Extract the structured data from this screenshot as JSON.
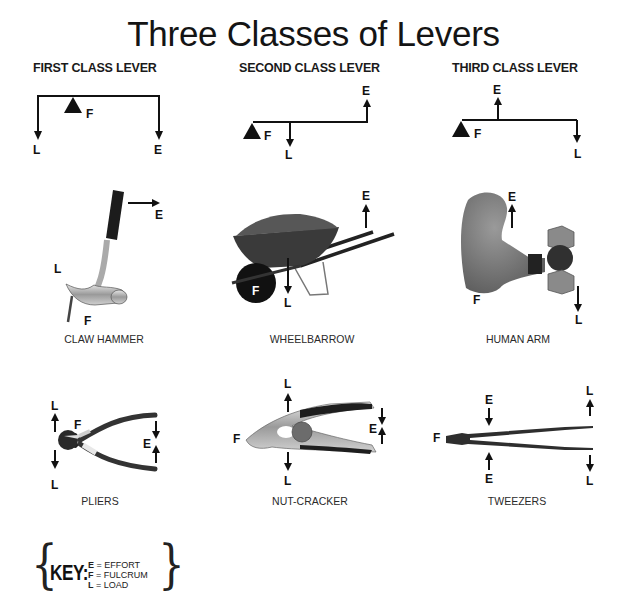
{
  "title": "Three Classes of Levers",
  "columns": [
    {
      "heading": "FIRST CLASS LEVER",
      "diagram": {
        "labels": {
          "fulcrum": "F",
          "load": "L",
          "effort": "E"
        }
      },
      "examples": [
        {
          "name": "CLAW HAMMER",
          "labels": {
            "effort": "E",
            "load": "L",
            "fulcrum": "F"
          }
        },
        {
          "name": "PLIERS",
          "labels": {
            "load_top": "L",
            "load_bottom": "L",
            "fulcrum": "F",
            "effort": "E"
          }
        }
      ]
    },
    {
      "heading": "SECOND CLASS LEVER",
      "diagram": {
        "labels": {
          "fulcrum": "F",
          "load": "L",
          "effort": "E"
        }
      },
      "examples": [
        {
          "name": "WHEELBARROW",
          "labels": {
            "effort": "E",
            "load": "L",
            "fulcrum": "F"
          }
        },
        {
          "name": "NUT-CRACKER",
          "labels": {
            "load_top": "L",
            "load_bottom": "L",
            "fulcrum": "F",
            "effort": "E"
          }
        }
      ]
    },
    {
      "heading": "THIRD CLASS LEVER",
      "diagram": {
        "labels": {
          "fulcrum": "F",
          "load": "L",
          "effort": "E"
        }
      },
      "examples": [
        {
          "name": "HUMAN ARM",
          "labels": {
            "effort": "E",
            "load": "L",
            "fulcrum": "F"
          }
        },
        {
          "name": "TWEEZERS",
          "labels": {
            "effort_top": "E",
            "effort_bottom": "E",
            "fulcrum": "F",
            "load_top": "L",
            "load_bottom": "L"
          }
        }
      ]
    }
  ],
  "key": {
    "label": "KEY:",
    "open_brace": "{",
    "close_brace": "}",
    "items": [
      {
        "letter": "E",
        "meaning": "= EFFORT"
      },
      {
        "letter": "F",
        "meaning": "= FULCRUM"
      },
      {
        "letter": "L",
        "meaning": "= LOAD"
      }
    ]
  },
  "colors": {
    "ink": "#111111",
    "background": "#ffffff",
    "metal": "#b8b8b8",
    "grip": "#1e1e1e",
    "skin": "#7a7a7a"
  }
}
